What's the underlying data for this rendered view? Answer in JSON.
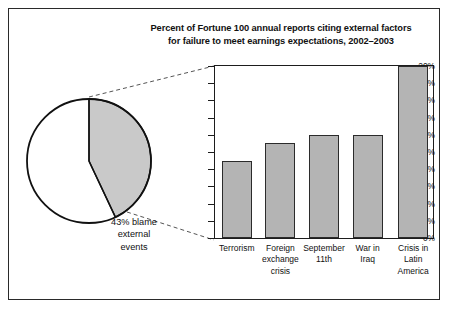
{
  "figure": {
    "title_lines": [
      "Percent of Fortune 100 annual reports citing external factors",
      "for failure to meet earnings expectations, 2002–2003"
    ],
    "background_color": "#ffffff",
    "frame_color": "#2a2a2a"
  },
  "pie": {
    "slice_percent": 43,
    "label_lines": [
      "43% blame",
      "external",
      "events"
    ],
    "slice_fill": "#c9c9c9",
    "rest_fill": "#ffffff",
    "outline_color": "#111111"
  },
  "leader_lines": {
    "style": "dashed",
    "color": "#555555",
    "count": 2
  },
  "chart_data": {
    "type": "bar",
    "title": "Percent of Fortune 100 annual reports citing external factors for failure to meet earnings expectations, 2002–2003",
    "categories": [
      "Terrorism",
      "Foreign exchange crisis",
      "September 11th",
      "War in Iraq",
      "Crisis in Latin America"
    ],
    "category_lines": [
      [
        "Terrorism"
      ],
      [
        "Foreign",
        "exchange",
        "crisis"
      ],
      [
        "September",
        "11th"
      ],
      [
        "War in",
        "Iraq"
      ],
      [
        "Crisis in",
        "Latin",
        "America"
      ]
    ],
    "values": [
      9,
      11,
      12,
      12,
      20
    ],
    "xlabel": "",
    "ylabel": "",
    "ylim": [
      0,
      20
    ],
    "ytick_values": [
      0,
      2,
      4,
      6,
      8,
      10,
      12,
      14,
      16,
      18,
      20
    ],
    "ytick_labels": [
      "0%",
      "2%",
      "4%",
      "6%",
      "8%",
      "10%",
      "12%",
      "14%",
      "16%",
      "18%",
      "20%"
    ],
    "grid": false,
    "legend": null,
    "bar_fill": "#b4b4b4",
    "bar_edge": "#2b2b2b"
  }
}
